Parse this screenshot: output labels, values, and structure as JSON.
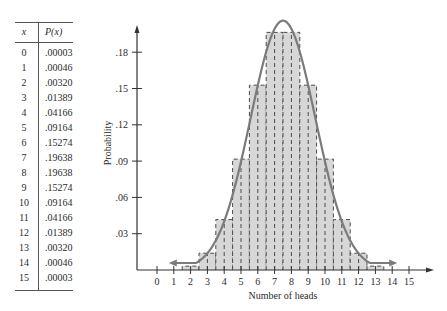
{
  "table": {
    "header_x": "x",
    "header_px": "P(x)",
    "rows": [
      {
        "x": "0",
        "p": ".00003"
      },
      {
        "x": "1",
        "p": ".00046"
      },
      {
        "x": "2",
        "p": ".00320"
      },
      {
        "x": "3",
        "p": ".01389"
      },
      {
        "x": "4",
        "p": ".04166"
      },
      {
        "x": "5",
        "p": ".09164"
      },
      {
        "x": "6",
        "p": ".15274"
      },
      {
        "x": "7",
        "p": ".19638"
      },
      {
        "x": "8",
        "p": ".19638"
      },
      {
        "x": "9",
        "p": ".15274"
      },
      {
        "x": "10",
        "p": ".09164"
      },
      {
        "x": "11",
        "p": ".04166"
      },
      {
        "x": "12",
        "p": ".01389"
      },
      {
        "x": "13",
        "p": ".00320"
      },
      {
        "x": "14",
        "p": ".00046"
      },
      {
        "x": "15",
        "p": ".00003"
      }
    ]
  },
  "colors": {
    "bar_fill": "#d7d7d7",
    "bar_edge": "#4a4a4a",
    "curve": "#7b7b7b",
    "axis": "#333333"
  },
  "chart_data": {
    "type": "bar",
    "title": "",
    "xlabel": "Number of heads",
    "ylabel": "Probability",
    "categories": [
      "0",
      "1",
      "2",
      "3",
      "4",
      "5",
      "6",
      "7",
      "8",
      "9",
      "10",
      "11",
      "12",
      "13",
      "14",
      "15"
    ],
    "values": [
      3e-05,
      0.00046,
      0.0032,
      0.01389,
      0.04166,
      0.09164,
      0.15274,
      0.19638,
      0.19638,
      0.15274,
      0.09164,
      0.04166,
      0.01389,
      0.0032,
      0.00046,
      3e-05
    ],
    "x_ticks": [
      "0",
      "1",
      "2",
      "3",
      "4",
      "5",
      "6",
      "7",
      "8",
      "9",
      "10",
      "11",
      "12",
      "13",
      "14",
      "15"
    ],
    "y_ticks": [
      ".03",
      ".06",
      ".09",
      ".12",
      ".15",
      ".18"
    ],
    "y_tick_values": [
      0.03,
      0.06,
      0.09,
      0.12,
      0.15,
      0.18
    ],
    "ylim": [
      0,
      0.2
    ],
    "xlim": [
      -1,
      16
    ],
    "grid": false,
    "overlay": {
      "type": "normal_curve",
      "mean": 7.5,
      "sd": 1.936,
      "x_range": [
        1,
        14
      ]
    },
    "bar_style": "histogram with dashed outlines, width 1 centered on each x"
  }
}
